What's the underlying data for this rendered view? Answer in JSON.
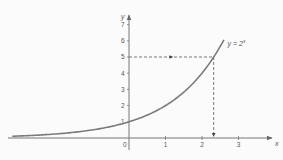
{
  "chart_data": {
    "type": "line",
    "title": "",
    "xlabel": "x",
    "ylabel": "y",
    "xlim": [
      -3.3,
      3.9
    ],
    "ylim": [
      0,
      8
    ],
    "grid": false,
    "x_ticks": [
      1,
      2,
      3
    ],
    "y_ticks": [
      1,
      2,
      3,
      4,
      5,
      6,
      7
    ],
    "origin_label": "0",
    "series": [
      {
        "name": "y = 2^x",
        "function": "2^x",
        "x_range": [
          -3.2,
          2.6
        ],
        "color": "#7a7a7a"
      }
    ],
    "annotations": [
      {
        "type": "curve_label",
        "text": "y = 2",
        "superscript": "x",
        "x": 2.7,
        "y": 5.8
      },
      {
        "type": "dashed_horizontal",
        "y": 5,
        "from_x": 0,
        "to_x": 2.32,
        "arrow": "right"
      },
      {
        "type": "dashed_vertical",
        "x": 2.32,
        "from_y": 5,
        "to_y": 0,
        "arrow": "down"
      }
    ]
  }
}
